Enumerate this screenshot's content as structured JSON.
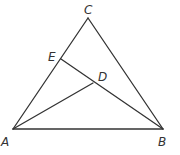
{
  "diagram": {
    "type": "geometry-triangle",
    "points": {
      "A": {
        "label": "A",
        "x": 13,
        "y": 129,
        "lx": 1,
        "ly": 146
      },
      "B": {
        "label": "B",
        "x": 163,
        "y": 129,
        "lx": 158,
        "ly": 146
      },
      "C": {
        "label": "C",
        "x": 88,
        "y": 18,
        "lx": 84,
        "ly": 14
      },
      "E": {
        "label": "E",
        "x": 61,
        "y": 59,
        "lx": 48,
        "ly": 61
      },
      "D": {
        "label": "D",
        "x": 93,
        "y": 83,
        "lx": 98,
        "ly": 81
      }
    },
    "segments": [
      [
        "A",
        "B"
      ],
      [
        "B",
        "C"
      ],
      [
        "C",
        "A"
      ],
      [
        "E",
        "B"
      ],
      [
        "A",
        "D"
      ]
    ],
    "stroke_color": "#333333"
  }
}
